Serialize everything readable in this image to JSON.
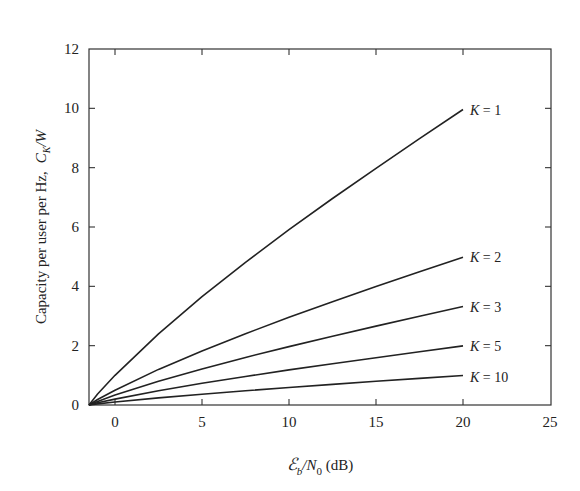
{
  "chart_data": {
    "type": "line",
    "title": "",
    "xlabel": "ℰ_b/N_0 (dB)",
    "ylabel": "Capacity per user per Hz, C_K/W",
    "xlim": [
      -1.59,
      25
    ],
    "ylim": [
      0,
      12
    ],
    "xticks": [
      0,
      5,
      10,
      15,
      20,
      25
    ],
    "yticks": [
      0,
      2,
      4,
      6,
      8,
      10,
      12
    ],
    "grid": false,
    "legend": "inline labels at curve ends",
    "x": [
      -1.59,
      -1,
      0,
      2.5,
      5,
      7.5,
      10,
      12.5,
      15,
      17.5,
      20
    ],
    "series": [
      {
        "name": "K = 1",
        "label_k": "1",
        "values": [
          0,
          0.37,
          1.0,
          2.4,
          3.65,
          4.81,
          5.91,
          6.96,
          7.98,
          8.98,
          9.96
        ]
      },
      {
        "name": "K = 2",
        "label_k": "2",
        "values": [
          0,
          0.185,
          0.5,
          1.2,
          1.825,
          2.405,
          2.955,
          3.48,
          3.99,
          4.49,
          4.98
        ]
      },
      {
        "name": "K = 3",
        "label_k": "3",
        "values": [
          0,
          0.123,
          0.333,
          0.8,
          1.217,
          1.603,
          1.97,
          2.32,
          2.66,
          2.993,
          3.32
        ]
      },
      {
        "name": "K = 5",
        "label_k": "5",
        "values": [
          0,
          0.074,
          0.2,
          0.48,
          0.73,
          0.962,
          1.182,
          1.392,
          1.596,
          1.796,
          1.992
        ]
      },
      {
        "name": "K = 10",
        "label_k": "10",
        "values": [
          0,
          0.037,
          0.1,
          0.24,
          0.365,
          0.481,
          0.591,
          0.696,
          0.798,
          0.898,
          0.996
        ]
      }
    ]
  },
  "labels": {
    "xlabel_script": "ℰ",
    "xlabel_sub_b": "b",
    "xlabel_slash_n": "/N",
    "xlabel_sub_0": "0",
    "xlabel_units": " (dB)",
    "ylabel_main": "Capacity per user per Hz,",
    "ylabel_c": "C",
    "ylabel_sub_k": "K",
    "ylabel_w": "/W",
    "curve_k": "K",
    "curve_eq": " = "
  }
}
